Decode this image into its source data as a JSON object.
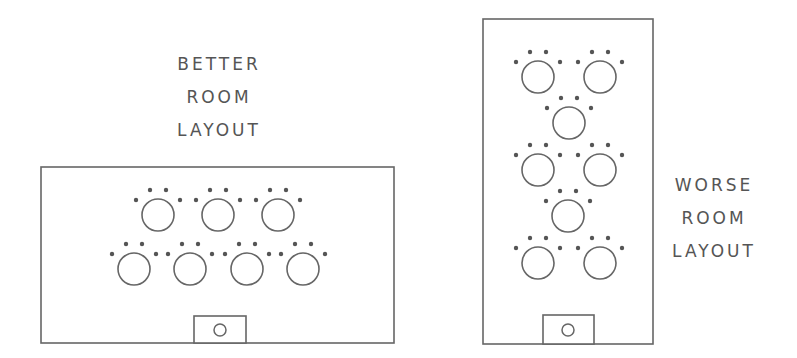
{
  "colors": {
    "stroke": "#666666",
    "dot": "#555555",
    "text": "#555555",
    "background": "#ffffff"
  },
  "better_layout": {
    "label_lines": [
      "BETTER",
      "ROOM",
      "LAYOUT"
    ],
    "room": {
      "x": 41,
      "y": 167,
      "width": 353,
      "height": 176
    },
    "podium": {
      "x": 194,
      "y": 316,
      "width": 52,
      "height": 27,
      "circle": {
        "cx": 220,
        "cy": 330,
        "r": 6
      }
    },
    "tables": [
      {
        "row": 1,
        "cx": 158,
        "cy": 215
      },
      {
        "row": 1,
        "cx": 218,
        "cy": 215
      },
      {
        "row": 1,
        "cx": 278,
        "cy": 215
      },
      {
        "row": 2,
        "cx": 134,
        "cy": 269
      },
      {
        "row": 2,
        "cx": 190,
        "cy": 269
      },
      {
        "row": 2,
        "cx": 247,
        "cy": 269
      },
      {
        "row": 2,
        "cx": 303,
        "cy": 269
      }
    ]
  },
  "worse_layout": {
    "label_lines": [
      "WORSE",
      "ROOM",
      "LAYOUT"
    ],
    "room": {
      "x": 483,
      "y": 19,
      "width": 170,
      "height": 325
    },
    "podium": {
      "x": 543,
      "y": 315,
      "width": 51,
      "height": 29,
      "circle": {
        "cx": 568,
        "cy": 330,
        "r": 6
      }
    },
    "tables": [
      {
        "row": 1,
        "cx": 538,
        "cy": 77
      },
      {
        "row": 1,
        "cx": 600,
        "cy": 77
      },
      {
        "row": 2,
        "cx": 569,
        "cy": 123
      },
      {
        "row": 3,
        "cx": 538,
        "cy": 170
      },
      {
        "row": 3,
        "cx": 600,
        "cy": 170
      },
      {
        "row": 4,
        "cx": 568,
        "cy": 216
      },
      {
        "row": 5,
        "cx": 538,
        "cy": 263
      },
      {
        "row": 5,
        "cx": 600,
        "cy": 263
      }
    ]
  },
  "table_style": {
    "radius": 16,
    "seat_radius": 2.2,
    "seat_offsets": [
      [
        -22,
        -15
      ],
      [
        -8,
        -25
      ],
      [
        8,
        -25
      ],
      [
        22,
        -15
      ]
    ]
  }
}
